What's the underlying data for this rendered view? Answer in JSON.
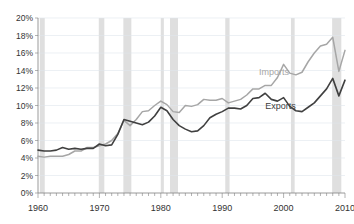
{
  "chart_data": {
    "type": "line",
    "title": "",
    "xlabel": "",
    "ylabel": "",
    "xlim": [
      1960,
      2010
    ],
    "ylim": [
      0,
      0.2
    ],
    "grid": true,
    "legend_position": "inline-annotation",
    "y_tick_labels": [
      "0%",
      "2%",
      "4%",
      "6%",
      "8%",
      "10%",
      "12%",
      "14%",
      "16%",
      "18%",
      "20%"
    ],
    "y_tick_values": [
      0,
      2,
      4,
      6,
      8,
      10,
      12,
      14,
      16,
      18,
      20
    ],
    "x_tick_labels": [
      "1960",
      "1970",
      "1980",
      "1990",
      "2000",
      "2010"
    ],
    "x_tick_values": [
      1960,
      1970,
      1980,
      1990,
      2000,
      2010
    ],
    "x": [
      1960,
      1961,
      1962,
      1963,
      1964,
      1965,
      1966,
      1967,
      1968,
      1969,
      1970,
      1971,
      1972,
      1973,
      1974,
      1975,
      1976,
      1977,
      1978,
      1979,
      1980,
      1981,
      1982,
      1983,
      1984,
      1985,
      1986,
      1987,
      1988,
      1989,
      1990,
      1991,
      1992,
      1993,
      1994,
      1995,
      1996,
      1997,
      1998,
      1999,
      2000,
      2001,
      2002,
      2003,
      2004,
      2005,
      2006,
      2007,
      2008,
      2009,
      2010
    ],
    "series": [
      {
        "name": "Imports",
        "color": "#a6a6a6",
        "label_year": 1996,
        "label_value": 13.5,
        "values": [
          4.2,
          4.1,
          4.2,
          4.2,
          4.2,
          4.4,
          4.8,
          4.8,
          5.2,
          5.2,
          5.4,
          5.6,
          6.0,
          6.8,
          8.3,
          7.7,
          8.4,
          9.3,
          9.4,
          10.0,
          10.5,
          10.1,
          9.3,
          9.2,
          10.0,
          9.9,
          10.1,
          10.7,
          10.6,
          10.6,
          10.8,
          10.3,
          10.5,
          10.7,
          11.2,
          11.9,
          11.9,
          12.3,
          12.3,
          13.2,
          14.7,
          13.7,
          13.5,
          13.8,
          15.0,
          16.0,
          16.8,
          17.0,
          17.8,
          13.9,
          16.3
        ]
      },
      {
        "name": "Exports",
        "color": "#404040",
        "label_year": 1997,
        "label_value": 9.6,
        "values": [
          4.9,
          4.8,
          4.8,
          4.9,
          5.2,
          5.0,
          5.1,
          5.0,
          5.1,
          5.1,
          5.6,
          5.4,
          5.5,
          6.7,
          8.4,
          8.2,
          8.0,
          7.8,
          8.1,
          8.8,
          9.8,
          9.4,
          8.4,
          7.7,
          7.3,
          7.0,
          7.1,
          7.7,
          8.6,
          9.0,
          9.3,
          9.7,
          9.7,
          9.6,
          10.0,
          10.8,
          10.9,
          11.4,
          10.7,
          10.5,
          10.9,
          9.9,
          9.4,
          9.3,
          9.8,
          10.3,
          11.1,
          11.9,
          13.1,
          11.1,
          12.9
        ]
      }
    ],
    "recession_bands": [
      {
        "start": 1960.3,
        "end": 1961.1
      },
      {
        "start": 1969.9,
        "end": 1970.8
      },
      {
        "start": 1973.9,
        "end": 1975.2
      },
      {
        "start": 1980.0,
        "end": 1980.5
      },
      {
        "start": 1981.5,
        "end": 1982.8
      },
      {
        "start": 1990.5,
        "end": 1991.2
      },
      {
        "start": 2001.2,
        "end": 2001.8
      },
      {
        "start": 2007.9,
        "end": 2009.4
      }
    ],
    "annotations": [
      {
        "name": "imports-label",
        "text": "Imports"
      },
      {
        "name": "exports-label",
        "text": "Exports"
      }
    ]
  },
  "labels": {
    "imports": "Imports",
    "exports": "Exports"
  }
}
